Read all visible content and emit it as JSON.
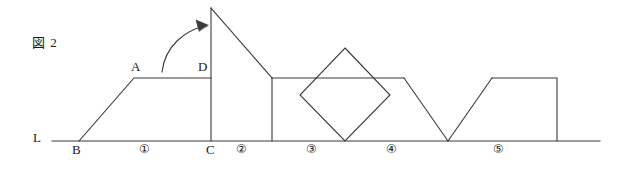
{
  "figure": {
    "caption": "図 2",
    "caption_x": 32,
    "caption_y": 36,
    "stroke_color": "#3a3a3a",
    "background_color": "#ffffff",
    "width": 623,
    "height": 169
  },
  "baseline": {
    "name": "line-L",
    "label": "L",
    "label_x": 33,
    "label_y": 137,
    "y": 141,
    "x_start": 52,
    "x_end": 600
  },
  "point_labels": [
    {
      "id": "A",
      "text": "A",
      "x": 131,
      "y": 66
    },
    {
      "id": "D",
      "text": "D",
      "x": 198,
      "y": 66
    },
    {
      "id": "B",
      "text": "B",
      "x": 72,
      "y": 147
    },
    {
      "id": "C",
      "text": "C",
      "x": 206,
      "y": 147
    }
  ],
  "segment_labels": [
    {
      "id": "seg1",
      "text": "①",
      "x": 139,
      "y": 147
    },
    {
      "id": "seg2",
      "text": "②",
      "x": 236,
      "y": 147
    },
    {
      "id": "seg3",
      "text": "③",
      "x": 306,
      "y": 147
    },
    {
      "id": "seg4",
      "text": "④",
      "x": 386,
      "y": 147
    },
    {
      "id": "seg5",
      "text": "⑤",
      "x": 493,
      "y": 147
    }
  ],
  "shapes": {
    "trapezoid_ABCD": {
      "name": "trapezoid-left",
      "points": "79,141 134,78 211,78 211,141"
    },
    "triangle_right_of_C": {
      "name": "triangle-apex",
      "points": "211,8 272,78 211,78"
    },
    "vertical_at_C": {
      "name": "vertical-line-c",
      "x1": 211,
      "y1": 8,
      "x2": 211,
      "y2": 141
    },
    "rect_block_3": {
      "name": "rectangle-block-three",
      "points": "272,78 272,141"
    },
    "top_line_3_4": {
      "name": "top-line-segment",
      "x1": 272,
      "y1": 78,
      "x2": 404,
      "y2": 78
    },
    "diamond": {
      "name": "diamond-square",
      "points": "345,48 390,95 345,141 300,95"
    },
    "diagonal_down": {
      "name": "diagonal-descending",
      "x1": 404,
      "y1": 78,
      "x2": 448,
      "y2": 141
    },
    "diagonal_up": {
      "name": "diagonal-ascending",
      "x1": 448,
      "y1": 141,
      "x2": 492,
      "y2": 78
    },
    "rect_block_5": {
      "name": "rectangle-block-five",
      "points": "492,78 557,78 557,141"
    }
  },
  "arrow": {
    "name": "rotation-arrow",
    "path": "M 162,72 C 165,46 185,30 206,26",
    "head": "206,26 197,21 198,31"
  }
}
